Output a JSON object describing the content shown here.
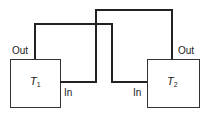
{
  "diagram": {
    "type": "block-interconnection",
    "blocks": [
      {
        "id": "T1",
        "label": "T",
        "subscript": "1",
        "ports": {
          "out": "Out",
          "in": "In"
        }
      },
      {
        "id": "T2",
        "label": "T",
        "subscript": "2",
        "ports": {
          "out": "Out",
          "in": "In"
        }
      }
    ],
    "connections": [
      {
        "from": "T1.Out",
        "to": "T2.In"
      },
      {
        "from": "T2.Out",
        "to": "T1.In"
      }
    ],
    "colors": {
      "line": "#222222",
      "background": "#ffffff"
    }
  }
}
